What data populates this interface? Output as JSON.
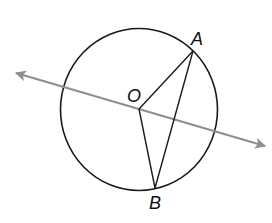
{
  "diagram": {
    "type": "geometry",
    "colors": {
      "background": "#ffffff",
      "stroke": "#1a1a1a",
      "line": "#8f8f8f",
      "label": "#111111"
    },
    "circle": {
      "cx": 139,
      "cy": 109.5,
      "rx": 78.5,
      "ry": 81
    },
    "points": {
      "O": {
        "label": "O",
        "x": 139,
        "y": 109,
        "label_x": 127,
        "label_y": 102
      },
      "A": {
        "label": "A",
        "x": 193,
        "y": 51,
        "label_x": 191,
        "label_y": 45
      },
      "B": {
        "label": "B",
        "x": 155,
        "y": 188,
        "label_x": 149,
        "label_y": 209
      }
    },
    "segments": [
      {
        "name": "OA",
        "from": "O",
        "to": "A"
      },
      {
        "name": "OB",
        "from": "O",
        "to": "B"
      },
      {
        "name": "AB",
        "from": "A",
        "to": "B"
      }
    ],
    "line": {
      "name": "line-through-O",
      "x1": 16,
      "y1": 73,
      "x2": 265,
      "y2": 146,
      "arrows": "both"
    }
  }
}
